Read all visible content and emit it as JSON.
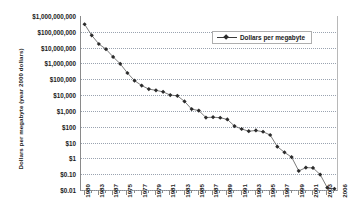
{
  "chart_data": {
    "type": "line",
    "title": "",
    "subtitle": "",
    "xlabel": "",
    "ylabel": "Dollars per megabyte (year 2000 dollars)",
    "y_scale": "log",
    "ylim": [
      0.01,
      1000000000
    ],
    "xlim": [
      1980,
      2006
    ],
    "grid": true,
    "legend_position": "top-right",
    "legend_entries": [
      "Dollars per megabyte"
    ],
    "y_tick_labels": [
      "$1,000,000,000",
      "$100,000,000",
      "$10,000,000",
      "$1,000,000",
      "$100,000",
      "$10,000",
      "$1,000",
      "$100",
      "$10",
      "$1",
      "$0.10",
      "$0.01"
    ],
    "y_tick_values": [
      1000000000,
      100000000,
      10000000,
      1000000,
      100000,
      10000,
      1000,
      100,
      10,
      1,
      0.1,
      0.01
    ],
    "x_tick_labels": [
      "1980",
      "1983",
      "1987",
      "1975",
      "1977",
      "1979",
      "1981",
      "1983",
      "1985",
      "1987",
      "1989",
      "1991",
      "1993",
      "1995",
      "1997",
      "1999",
      "2001",
      "2003",
      "2006"
    ],
    "x_labeled_years": [
      1980,
      1981,
      1982,
      1983,
      1984,
      1985,
      1986,
      1987,
      1988,
      1989,
      1990,
      1991,
      1992,
      1993,
      1994,
      1995,
      1996,
      1997,
      1998
    ],
    "categories": [
      1980,
      1981,
      1982,
      1983,
      1984,
      1985,
      1986,
      1987,
      1988,
      1989,
      1990,
      1991,
      1992,
      1993,
      1994,
      1995,
      1996,
      1997,
      1998,
      1999,
      2000,
      2001,
      2002,
      2003,
      2004,
      2005,
      2006,
      2007,
      2008,
      2009,
      2010,
      2011,
      2012,
      2013,
      2014,
      2015
    ],
    "series": [
      {
        "name": "Dollars per megabyte",
        "marker": "diamond",
        "color": "#2b2b2b",
        "values": [
          300000000,
          60000000,
          17000000,
          8000000,
          2600000,
          950000,
          250000,
          82000,
          40000,
          24000,
          20000,
          16000,
          10000,
          9000,
          4000,
          1300,
          1050,
          380,
          400,
          370,
          290,
          110,
          72,
          52,
          58,
          48,
          30,
          5.5,
          2.4,
          1.2,
          0.16,
          0.26,
          0.25,
          0.095,
          0.014,
          0.012
        ]
      }
    ]
  },
  "legend": {
    "label": "Dollars per megabyte"
  },
  "axis": {
    "y_title": "Dollars per megabyte (year 2000 dollars)"
  }
}
